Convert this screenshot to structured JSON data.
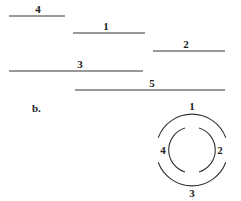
{
  "panel_a": {
    "segments": [
      {
        "label": "4",
        "x1": 9,
        "x2": 65,
        "y": 16
      },
      {
        "label": "1",
        "x1": 73,
        "x2": 145,
        "y": 33
      },
      {
        "label": "2",
        "x1": 153,
        "x2": 225,
        "y": 51
      },
      {
        "label": "3",
        "x1": 9,
        "x2": 143,
        "y": 71
      },
      {
        "label": "5",
        "x1": 75,
        "x2": 225,
        "y": 90
      }
    ]
  },
  "panel_b": {
    "label": "b.",
    "outer_arcs": {
      "top": "1",
      "bottom": "3"
    },
    "inner_arcs": {
      "left": "4",
      "right": "2"
    }
  }
}
